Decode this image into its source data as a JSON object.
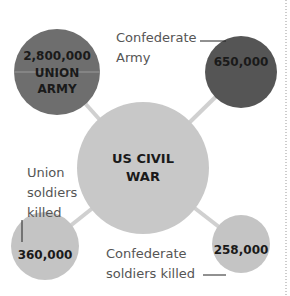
{
  "diagram": {
    "center": {
      "line1": "US CIVIL",
      "line2": "WAR",
      "color": "#c8c8c8"
    },
    "nodes": [
      {
        "id": "union-army",
        "value": "2,800,000",
        "label1": "UNION",
        "label2": "ARMY",
        "color": "#6e6e6e"
      },
      {
        "id": "confederate-army",
        "value": "650,000",
        "caption1": "Confederate",
        "caption2": "Army",
        "color": "#555555"
      },
      {
        "id": "union-killed",
        "value": "360,000",
        "caption1": "Union",
        "caption2": "soldiers",
        "caption3": "killed",
        "color": "#c4c4c4"
      },
      {
        "id": "confederate-killed",
        "value": "258,000",
        "caption1": "Confederate",
        "caption2": "soldiers killed",
        "color": "#c4c4c4"
      }
    ],
    "connector_color": "#d0d0d0",
    "divider_style": "dotted"
  }
}
